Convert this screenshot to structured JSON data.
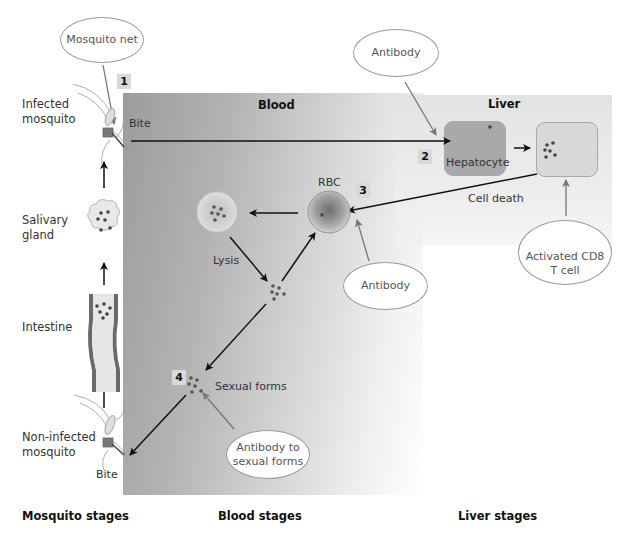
{
  "panels": {
    "blood": {
      "title": "Blood"
    },
    "liver": {
      "title": "Liver"
    }
  },
  "mosquito_column": {
    "infected_mosquito": "Infected mosquito",
    "salivary_gland": "Salivary gland",
    "intestine": "Intestine",
    "non_infected_mosquito": "Non-infected mosquito",
    "bite_bottom": "Bite"
  },
  "steps": {
    "step1": "1",
    "step2": "2",
    "step3": "3",
    "step4": "4"
  },
  "labels": {
    "bite_top": "Bite",
    "hepatocyte": "Hepatocyte",
    "cell_death": "Cell death",
    "rbc": "RBC",
    "lysis": "Lysis",
    "sexual_forms": "Sexual forms"
  },
  "interventions": {
    "mosquito_net": "Mosquito net",
    "antibody_liver": "Antibody",
    "antibody_rbc": "Antibody",
    "cd8_line1": "Activated CD8",
    "cd8_line2": "T cell",
    "antibody_sexual_line1": "Antibody to",
    "antibody_sexual_line2": "sexual forms"
  },
  "footer": {
    "mosquito_stages": "Mosquito stages",
    "blood_stages": "Blood stages",
    "liver_stages": "Liver stages"
  },
  "colors": {
    "arrow": "#111111",
    "intervention_arrow": "#7a7a7a",
    "hepatocyte_infected": "#a9a9a9",
    "hepatocyte_late": "#d6d6d6",
    "step_badge": "#d9d9d9"
  }
}
